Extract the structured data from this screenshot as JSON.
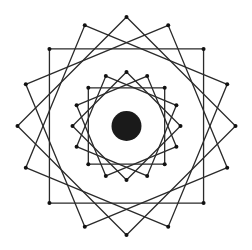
{
  "figure": {
    "width": 252,
    "height": 250,
    "background": "#ffffff",
    "stroke_color": "#2a2a2a",
    "vertex_color": "#111111",
    "center": [
      126.5,
      126
    ],
    "center_disk": {
      "radius": 15,
      "color": "#1a1a1a"
    },
    "rings": [
      {
        "name": "outer",
        "circumradius": 109,
        "squares": 4,
        "rotations_deg": [
          0,
          22.5,
          45,
          67.5
        ]
      },
      {
        "name": "inner",
        "circumradius": 54,
        "squares": 4,
        "rotations_deg": [
          0,
          22.5,
          45,
          67.5
        ]
      }
    ],
    "vertex_dot_radius": 2
  }
}
